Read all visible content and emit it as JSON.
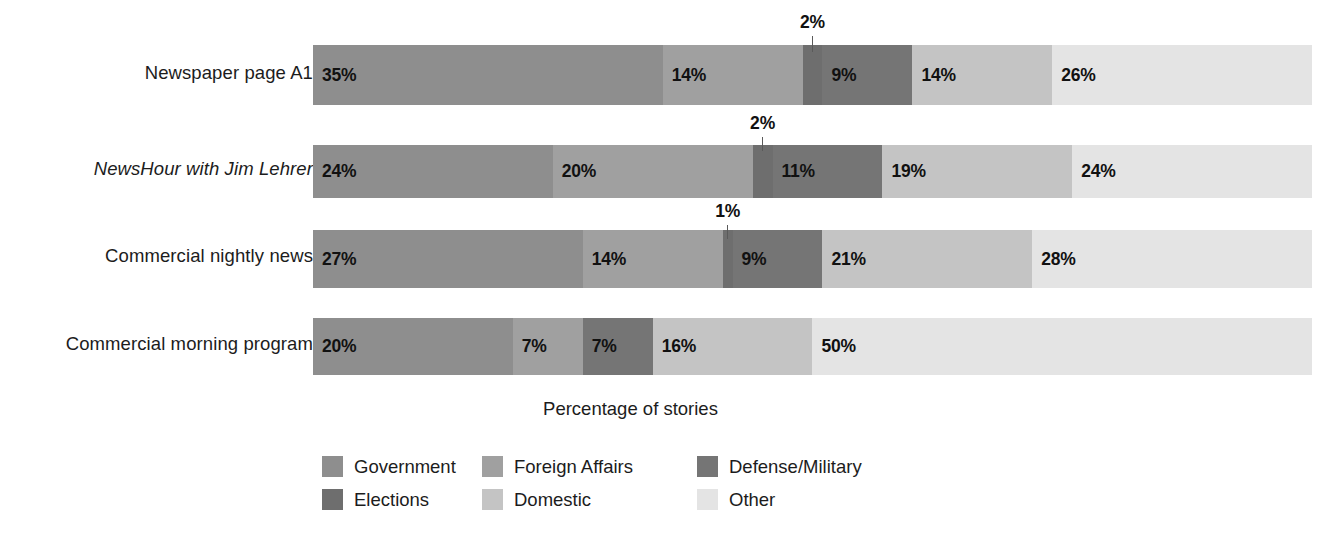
{
  "chart_data": {
    "type": "bar",
    "subtype": "stacked-horizontal-100pct",
    "title": "",
    "xlabel": "Percentage of stories",
    "ylabel": "",
    "xlim": [
      0,
      100
    ],
    "grid": false,
    "legend_position": "bottom",
    "categories": [
      "Newspaper page A1",
      "NewsHour with Jim Lehrer",
      "Commercial nightly news",
      "Commercial morning program"
    ],
    "series": [
      {
        "name": "Government",
        "color": "#8e8e8e",
        "values": [
          35,
          24,
          27,
          20
        ]
      },
      {
        "name": "Foreign Affairs",
        "color": "#a0a0a0",
        "values": [
          14,
          20,
          14,
          7
        ]
      },
      {
        "name": "Elections",
        "color": "#6e6e6e",
        "values": [
          2,
          2,
          1,
          0
        ]
      },
      {
        "name": "Defense/Military",
        "color": "#757575",
        "values": [
          9,
          11,
          9,
          7
        ]
      },
      {
        "name": "Domestic",
        "color": "#c4c4c4",
        "values": [
          14,
          19,
          21,
          16
        ]
      },
      {
        "name": "Other",
        "color": "#e4e4e4",
        "values": [
          26,
          24,
          28,
          50
        ]
      }
    ],
    "callouts": [
      {
        "row": 0,
        "label": "2%",
        "series": "Elections"
      },
      {
        "row": 1,
        "label": "2%",
        "series": "Elections"
      },
      {
        "row": 2,
        "label": "1%",
        "series": "Elections"
      }
    ]
  },
  "rows": [
    {
      "label": "Newspaper page A1",
      "italic": false,
      "top": 45,
      "height": 60,
      "label_top": 62,
      "segments": [
        {
          "series": "Government",
          "value": 35,
          "label": "35%",
          "show_label": true,
          "color": "#8e8e8e"
        },
        {
          "series": "Foreign Affairs",
          "value": 14,
          "label": "14%",
          "show_label": true,
          "color": "#a0a0a0"
        },
        {
          "series": "Elections",
          "value": 2,
          "label": "2%",
          "show_label": false,
          "color": "#6e6e6e"
        },
        {
          "series": "Defense/Military",
          "value": 9,
          "label": "9%",
          "show_label": true,
          "color": "#757575"
        },
        {
          "series": "Domestic",
          "value": 14,
          "label": "14%",
          "show_label": true,
          "color": "#c4c4c4"
        },
        {
          "series": "Other",
          "value": 26,
          "label": "26%",
          "show_label": true,
          "color": "#e4e4e4"
        }
      ],
      "callout": {
        "label": "2%",
        "center_pct": 50,
        "text_top": 14,
        "line_top": 36,
        "line_height": 16
      }
    },
    {
      "label": "NewsHour with Jim Lehrer",
      "italic": true,
      "top": 145,
      "height": 53,
      "label_top": 158,
      "segments": [
        {
          "series": "Government",
          "value": 24,
          "label": "24%",
          "show_label": true,
          "color": "#8e8e8e"
        },
        {
          "series": "Foreign Affairs",
          "value": 20,
          "label": "20%",
          "show_label": true,
          "color": "#a0a0a0"
        },
        {
          "series": "Elections",
          "value": 2,
          "label": "2%",
          "show_label": false,
          "color": "#6e6e6e"
        },
        {
          "series": "Defense/Military",
          "value": 11,
          "label": "11%",
          "show_label": true,
          "color": "#757575"
        },
        {
          "series": "Domestic",
          "value": 19,
          "label": "19%",
          "show_label": true,
          "color": "#c4c4c4"
        },
        {
          "series": "Other",
          "value": 24,
          "label": "24%",
          "show_label": true,
          "color": "#e4e4e4"
        }
      ],
      "callout": {
        "label": "2%",
        "center_pct": 45,
        "text_top": 115,
        "line_top": 137,
        "line_height": 14
      }
    },
    {
      "label": "Commercial nightly news",
      "italic": false,
      "top": 230,
      "height": 58,
      "label_top": 245,
      "segments": [
        {
          "series": "Government",
          "value": 27,
          "label": "27%",
          "show_label": true,
          "color": "#8e8e8e"
        },
        {
          "series": "Foreign Affairs",
          "value": 14,
          "label": "14%",
          "show_label": true,
          "color": "#a0a0a0"
        },
        {
          "series": "Elections",
          "value": 1,
          "label": "1%",
          "show_label": false,
          "color": "#6e6e6e"
        },
        {
          "series": "Defense/Military",
          "value": 9,
          "label": "9%",
          "show_label": true,
          "color": "#757575"
        },
        {
          "series": "Domestic",
          "value": 21,
          "label": "21%",
          "show_label": true,
          "color": "#c4c4c4"
        },
        {
          "series": "Other",
          "value": 28,
          "label": "28%",
          "show_label": true,
          "color": "#e4e4e4"
        }
      ],
      "callout": {
        "label": "1%",
        "center_pct": 41.5,
        "text_top": 203,
        "line_top": 223,
        "line_height": 14
      }
    },
    {
      "label": "Commercial morning program",
      "italic": false,
      "top": 318,
      "height": 57,
      "label_top": 333,
      "segments": [
        {
          "series": "Government",
          "value": 20,
          "label": "20%",
          "show_label": true,
          "color": "#8e8e8e"
        },
        {
          "series": "Foreign Affairs",
          "value": 7,
          "label": "7%",
          "show_label": true,
          "color": "#a0a0a0"
        },
        {
          "series": "Defense/Military",
          "value": 7,
          "label": "7%",
          "show_label": true,
          "color": "#757575"
        },
        {
          "series": "Domestic",
          "value": 16,
          "label": "16%",
          "show_label": true,
          "color": "#c4c4c4"
        },
        {
          "series": "Other",
          "value": 50,
          "label": "50%",
          "show_label": true,
          "color": "#e4e4e4"
        }
      ],
      "callout": null
    }
  ],
  "axis": {
    "caption": "Percentage of stories"
  },
  "legend": {
    "rows": [
      [
        {
          "label": "Government",
          "color": "#8e8e8e"
        },
        {
          "label": "Foreign Affairs",
          "color": "#a0a0a0"
        },
        {
          "label": "Defense/Military",
          "color": "#757575"
        }
      ],
      [
        {
          "label": "Elections",
          "color": "#6e6e6e"
        },
        {
          "label": "Domestic",
          "color": "#c4c4c4"
        },
        {
          "label": "Other",
          "color": "#e4e4e4"
        }
      ]
    ]
  }
}
